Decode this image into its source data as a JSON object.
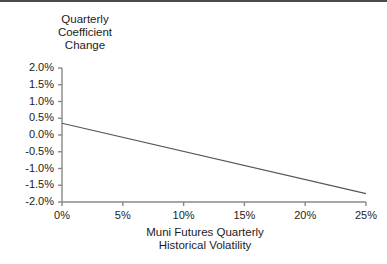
{
  "chart_data": {
    "type": "scatter",
    "title_lines": [
      "Quarterly",
      "Coefficient",
      "Change"
    ],
    "xlabel": "Muni Futures Quarterly\nHistorical Volatility",
    "xlabel_lines": [
      "Muni Futures Quarterly",
      "Historical Volatility"
    ],
    "ylabel": "Quarterly Coefficient Change",
    "xlim": [
      0,
      25
    ],
    "ylim": [
      -2.0,
      2.0
    ],
    "xticks": [
      0,
      5,
      10,
      15,
      20,
      25
    ],
    "xticklabels": [
      "0%",
      "5%",
      "10%",
      "15%",
      "20%",
      "25%"
    ],
    "yticks": [
      2.0,
      1.5,
      1.0,
      0.5,
      0.0,
      -0.5,
      -1.0,
      -1.5,
      -2.0
    ],
    "yticklabels": [
      "2.0%",
      "1.5%",
      "1.0%",
      "0.5%",
      "0.0%",
      "-0.5%",
      "-1.0%",
      "-1.5%",
      "-2.0%"
    ],
    "grid": false,
    "legend": false,
    "marker_color": "#111111",
    "line_color": "#555555",
    "axis_color": "#888888",
    "points": [
      {
        "x": 4.6,
        "y": -0.22
      },
      {
        "x": 5.1,
        "y": -0.3
      },
      {
        "x": 5.3,
        "y": -0.18
      },
      {
        "x": 5.5,
        "y": -0.26
      },
      {
        "x": 5.6,
        "y": -0.48
      },
      {
        "x": 5.7,
        "y": -0.38
      },
      {
        "x": 5.8,
        "y": 0.4
      },
      {
        "x": 5.9,
        "y": 0.18
      },
      {
        "x": 5.9,
        "y": -0.55
      },
      {
        "x": 6.0,
        "y": -0.3
      },
      {
        "x": 6.1,
        "y": -0.72
      },
      {
        "x": 6.2,
        "y": -0.44
      },
      {
        "x": 6.3,
        "y": -0.36
      },
      {
        "x": 6.5,
        "y": 0.52
      },
      {
        "x": 6.5,
        "y": -0.2
      },
      {
        "x": 6.6,
        "y": -0.5
      },
      {
        "x": 6.7,
        "y": -0.42
      },
      {
        "x": 6.8,
        "y": -0.34
      },
      {
        "x": 6.9,
        "y": 0.9
      },
      {
        "x": 6.9,
        "y": -0.26
      },
      {
        "x": 7.0,
        "y": -0.46
      },
      {
        "x": 7.1,
        "y": -0.16
      },
      {
        "x": 7.1,
        "y": -0.54
      },
      {
        "x": 7.2,
        "y": 0.62
      },
      {
        "x": 7.2,
        "y": -0.38
      },
      {
        "x": 7.3,
        "y": -0.48
      },
      {
        "x": 7.3,
        "y": -0.58
      },
      {
        "x": 7.4,
        "y": 0.22
      },
      {
        "x": 7.4,
        "y": -0.44
      },
      {
        "x": 7.5,
        "y": -0.52
      },
      {
        "x": 7.6,
        "y": -0.84
      },
      {
        "x": 8.0,
        "y": -0.46
      },
      {
        "x": 8.6,
        "y": -0.2
      },
      {
        "x": 9.0,
        "y": -0.34
      },
      {
        "x": 9.3,
        "y": -0.18
      },
      {
        "x": 9.4,
        "y": -0.38
      },
      {
        "x": 9.5,
        "y": -0.72
      },
      {
        "x": 12.0,
        "y": -0.42
      },
      {
        "x": 13.2,
        "y": 0.02
      },
      {
        "x": 13.3,
        "y": -0.36
      },
      {
        "x": 13.9,
        "y": 0.12
      },
      {
        "x": 15.0,
        "y": -1.38
      },
      {
        "x": 18.6,
        "y": -0.38
      },
      {
        "x": 20.0,
        "y": -1.08
      }
    ],
    "trendline": {
      "x_start": 0,
      "y_start": 0.35,
      "x_end": 25,
      "y_end": -1.75,
      "slope": -0.084,
      "intercept": 0.35
    }
  }
}
